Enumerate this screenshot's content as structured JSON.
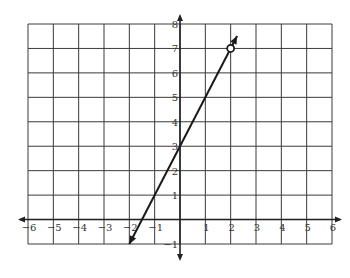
{
  "chart_data": {
    "type": "line",
    "title": "",
    "xlabel": "",
    "ylabel": "",
    "xlim": [
      -6,
      6
    ],
    "ylim": [
      -1,
      8
    ],
    "grid": true,
    "x_ticks": [
      "−6",
      "−5",
      "−4",
      "−3",
      "−2",
      "−1",
      "1",
      "2",
      "3",
      "4",
      "5",
      "6"
    ],
    "y_ticks": [
      "−1",
      "1",
      "2",
      "3",
      "4",
      "5",
      "6",
      "7",
      "8"
    ],
    "series": [
      {
        "name": "y = 2x + 3",
        "slope": 2,
        "intercept": 3,
        "points": [
          {
            "x": -2,
            "y": -1
          },
          {
            "x": 2,
            "y": 7
          }
        ],
        "start_marker": "arrow",
        "end_marker": "open-circle-then-arrow",
        "open_circle": {
          "x": 2,
          "y": 7
        }
      }
    ]
  },
  "colors": {
    "grid": "#3a3a3a",
    "axis": "#222222",
    "line": "#1a1a1a",
    "background": "#ffffff"
  }
}
